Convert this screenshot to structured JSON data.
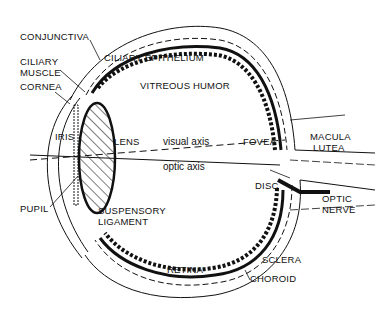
{
  "diagram": {
    "labels": {
      "conjunctiva": "CONJUNCTIVA",
      "ciliary_muscle_1": "CILIARY",
      "ciliary_muscle_2": "MUSCLE",
      "cornea": "CORNEA",
      "iris": "IRIS",
      "pupil": "PUPIL",
      "ciliary_epithelium": "CILIARY EPITHELIUM",
      "vitreous_humor": "VITREOUS HUMOR",
      "lens": "LENS",
      "visual_axis": "visual axis",
      "optic_axis": "optic axis",
      "fovea": "FOVEA",
      "macula_lutea_1": "MACULA",
      "macula_lutea_2": "LUTEA",
      "disc": "DISC",
      "optic_nerve_1": "OPTIC",
      "optic_nerve_2": "NERVE",
      "suspensory_ligament_1": "SUSPENSORY",
      "suspensory_ligament_2": "LIGAMENT",
      "retina": "RETINA",
      "sclera": "SCLERA",
      "choroid": "CHOROID"
    },
    "colors": {
      "ink": "#111111",
      "background": "#ffffff"
    }
  }
}
